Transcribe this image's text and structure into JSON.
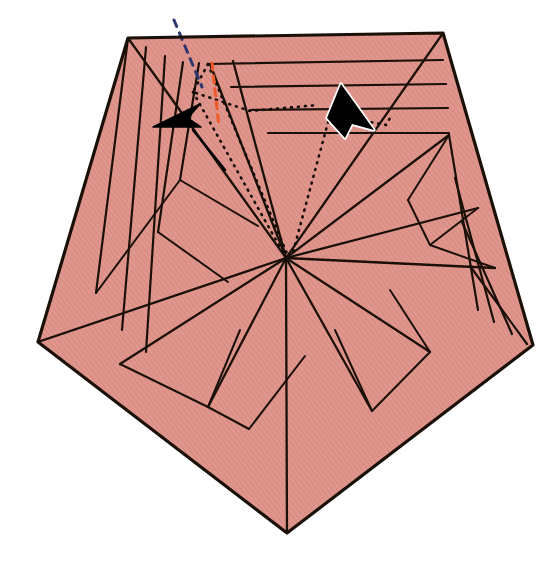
{
  "figure": {
    "canvas": {
      "width": 557,
      "height": 562
    },
    "background_color": "#ffffff",
    "fill_color": "#e0968c",
    "hatch_color": "#d3857b",
    "line_color": "#1a1008",
    "outline_width": 3.2,
    "crease_width": 2.2,
    "thin_crease_width": 1.8
  },
  "shape": {
    "name": "pentagon-body",
    "outline_points": "128,38 443,33 533,345 287,533 38,342",
    "vertices": [
      {
        "name": "top-left-corner",
        "x": 128,
        "y": 38
      },
      {
        "name": "top-right-corner",
        "x": 443,
        "y": 33
      },
      {
        "name": "right-corner",
        "x": 533,
        "y": 345
      },
      {
        "name": "bottom-corner",
        "x": 287,
        "y": 533
      },
      {
        "name": "left-corner",
        "x": 38,
        "y": 342
      }
    ],
    "hub": {
      "name": "central-hub",
      "x": 286,
      "y": 258
    }
  },
  "creases": {
    "hub_spokes": [
      "286,258 38,342",
      "286,258 128,38",
      "286,258 210,64",
      "286,258 233,61",
      "286,258 443,33",
      "286,258 449,135",
      "286,258 478,208",
      "286,258 495,268",
      "286,258 430,352",
      "286,258 372,411",
      "286,258 287,533",
      "286,258 208,407",
      "286,258 120,364"
    ],
    "left_fan": [
      "128,38 96,293",
      "146,47 122,330",
      "165,56 146,352",
      "183,62 158,232",
      "199,63 180,180"
    ],
    "top_right_bands": [
      "208,64 443,60",
      "231,87 446,84",
      "250,110 448,108",
      "268,133 449,133"
    ],
    "right_fan": [
      "449,135 478,310",
      "455,178 494,322",
      "462,222 512,334",
      "470,266 527,344"
    ],
    "bottom_left_bands": [
      "38,342 225,521",
      "62,366 244,530",
      "88,393 262,533"
    ],
    "bottom_right_bands": [
      "533,345 320,520",
      "512,378 302,528",
      "490,410 290,533"
    ],
    "inner_panels": [
      "180,180 258,226",
      "158,232 228,282",
      "96,293 180,180",
      "120,364 208,407",
      "208,407 240,330",
      "372,411 335,330",
      "430,352 390,290",
      "478,208 430,245",
      "430,245 408,200",
      "408,200 449,135",
      "495,268 430,245",
      "372,411 430,352",
      "249,429 305,356",
      "249,429 208,407"
    ]
  },
  "annotations": {
    "dotted_paths": [
      {
        "name": "left-dotted-path",
        "points": "208,64 193,92 250,111 318,105"
      },
      {
        "name": "left-dotted-descender",
        "points": "193,92 286,258"
      },
      {
        "name": "left-dotted-descender-two",
        "points": "208,64 288,256"
      },
      {
        "name": "right-dotted-path",
        "points": "330,115 386,125 390,118"
      },
      {
        "name": "right-dotted-descender",
        "points": "330,115 292,256"
      }
    ],
    "navy_dash": {
      "name": "navy-dashed-marker",
      "points": "174,20 202,87",
      "color": "#2c3670"
    },
    "orange_dash": {
      "name": "orange-dashed-marker",
      "points": "212,63 219,127",
      "color": "#f05a28"
    },
    "arrows": [
      {
        "name": "left-arrowhead",
        "label": "fold-direction-left",
        "points": "153,127 194,107 188,117 200,124",
        "fill": "#000000",
        "stroke": "#000000"
      },
      {
        "name": "right-arrowhead",
        "label": "fold-direction-right",
        "points": "340,85 372,128 353,124 345,136 330,118",
        "fill": "#000000",
        "stroke": "#ffffff"
      }
    ],
    "arrow_tails": [
      {
        "name": "left-arrow-tail",
        "points": "193,130 225,170"
      }
    ]
  }
}
